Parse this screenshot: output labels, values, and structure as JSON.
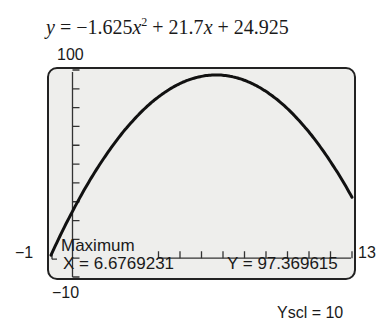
{
  "equation": {
    "y": "y",
    "eq_prefix": " = −1.625",
    "x1": "x",
    "exp": "2",
    "mid": " + 21.7",
    "x2": "x",
    "suffix": " + 24.925"
  },
  "window": {
    "ymax_label": "100",
    "ymin_label": "−10",
    "xmin_label": "−1",
    "xmax_label": "13",
    "yscl_label": "Yscl = 10"
  },
  "calculator": {
    "mode_label": "Maximum",
    "x_readout": "X = 6.6769231",
    "y_readout": "Y = 97.369615"
  },
  "colors": {
    "screen_bg": "#eeeeec",
    "curve": "#111111",
    "frame": "#222222"
  },
  "chart_data": {
    "type": "line",
    "function": {
      "a": -1.625,
      "b": 21.7,
      "c": 24.925
    },
    "xlim": [
      -1,
      13
    ],
    "ylim": [
      -10,
      100
    ],
    "xscl": 1,
    "yscl": 10,
    "grid": false,
    "x": [
      -1,
      0,
      1,
      2,
      3,
      4,
      5,
      6,
      6.6769231,
      7,
      8,
      9,
      10,
      11,
      12,
      13
    ],
    "series": [
      {
        "name": "y = −1.625x^2 + 21.7x + 24.925",
        "values": [
          1.6,
          24.925,
          45.0,
          61.825,
          75.4,
          85.725,
          92.8,
          96.625,
          97.369615,
          97.2,
          94.525,
          88.6,
          79.425,
          67.0,
          51.325,
          32.4
        ]
      }
    ],
    "annotations": [
      {
        "text": "Maximum",
        "x": 6.6769231,
        "y": 97.369615
      },
      {
        "text": "X = 6.6769231"
      },
      {
        "text": "Y = 97.369615"
      },
      {
        "text": "Yscl = 10"
      }
    ]
  }
}
